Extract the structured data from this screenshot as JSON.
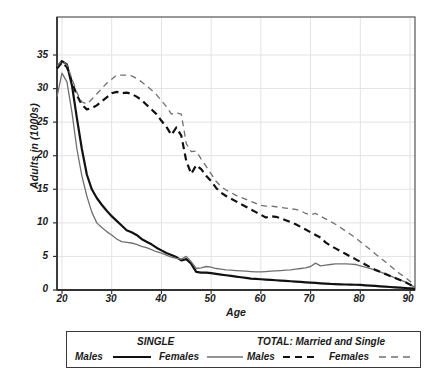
{
  "chart_data": {
    "type": "line",
    "title": "",
    "xlabel": "Age",
    "ylabel": "Adults in (1000s)",
    "xlim": [
      19,
      91
    ],
    "ylim": [
      0,
      38
    ],
    "xticks": [
      20,
      30,
      40,
      50,
      60,
      70,
      80,
      90
    ],
    "yticks": [
      0,
      5,
      10,
      15,
      20,
      25,
      30,
      35
    ],
    "grid": true,
    "legend_position": "below-plot",
    "x": [
      19,
      20,
      21,
      22,
      23,
      24,
      25,
      26,
      27,
      28,
      29,
      30,
      31,
      32,
      33,
      34,
      35,
      36,
      37,
      38,
      39,
      40,
      41,
      42,
      43,
      44,
      45,
      46,
      47,
      48,
      49,
      50,
      51,
      52,
      53,
      54,
      55,
      56,
      57,
      58,
      59,
      60,
      61,
      62,
      63,
      64,
      65,
      66,
      67,
      68,
      69,
      70,
      71,
      72,
      73,
      74,
      75,
      76,
      77,
      78,
      79,
      80,
      81,
      82,
      83,
      84,
      85,
      86,
      87,
      88,
      89,
      90,
      91
    ],
    "series": [
      {
        "name": "Males",
        "group": "SINGLE",
        "style": "solid",
        "color": "#111111",
        "width": 2.2,
        "values": [
          33.2,
          34.1,
          33.6,
          30.5,
          25.6,
          21.0,
          17.2,
          15.0,
          13.7,
          12.7,
          11.8,
          11.0,
          10.3,
          9.6,
          8.9,
          8.6,
          8.2,
          7.6,
          7.2,
          6.8,
          6.3,
          5.9,
          5.5,
          5.2,
          4.9,
          4.4,
          4.6,
          3.9,
          2.7,
          2.6,
          2.6,
          2.5,
          2.4,
          2.3,
          2.2,
          2.1,
          2.0,
          1.9,
          1.8,
          1.7,
          1.65,
          1.6,
          1.55,
          1.5,
          1.45,
          1.4,
          1.35,
          1.3,
          1.25,
          1.2,
          1.15,
          1.1,
          1.05,
          1.0,
          0.95,
          0.9,
          0.88,
          0.85,
          0.82,
          0.8,
          0.78,
          0.75,
          0.7,
          0.65,
          0.6,
          0.55,
          0.5,
          0.45,
          0.4,
          0.35,
          0.3,
          0.25,
          0.2
        ]
      },
      {
        "name": "Females",
        "group": "SINGLE",
        "style": "solid",
        "color": "#707070",
        "width": 1.3,
        "values": [
          28.8,
          32.3,
          31.0,
          26.5,
          21.0,
          17.0,
          14.0,
          11.6,
          10.0,
          9.3,
          8.7,
          8.2,
          7.6,
          7.2,
          7.1,
          7.0,
          6.8,
          6.5,
          6.3,
          6.0,
          5.7,
          5.5,
          5.2,
          4.9,
          4.7,
          4.6,
          5.0,
          4.2,
          3.2,
          3.3,
          3.5,
          3.4,
          3.2,
          3.1,
          3.0,
          2.95,
          2.9,
          2.85,
          2.8,
          2.75,
          2.7,
          2.7,
          2.75,
          2.8,
          2.85,
          2.9,
          2.95,
          3.0,
          3.1,
          3.2,
          3.3,
          3.5,
          4.0,
          3.6,
          3.7,
          3.8,
          3.9,
          3.9,
          3.9,
          3.85,
          3.8,
          3.6,
          3.4,
          3.2,
          3.0,
          2.7,
          2.4,
          2.1,
          1.8,
          1.5,
          1.2,
          0.8,
          0.4
        ]
      },
      {
        "name": "Males",
        "group": "TOTAL: Married and Single",
        "style": "dashed",
        "color": "#111111",
        "width": 2.2,
        "values": [
          33.0,
          33.9,
          33.2,
          31.0,
          29.0,
          27.6,
          26.9,
          27.1,
          27.5,
          28.1,
          28.7,
          29.3,
          29.5,
          29.3,
          29.4,
          29.2,
          28.8,
          28.3,
          27.6,
          26.9,
          26.2,
          25.2,
          24.3,
          23.1,
          24.2,
          23.0,
          19.2,
          17.3,
          18.6,
          18.0,
          17.0,
          16.2,
          15.2,
          14.5,
          14.0,
          13.6,
          13.2,
          12.8,
          12.4,
          12.0,
          11.6,
          11.2,
          10.8,
          11.0,
          10.9,
          10.7,
          10.4,
          10.1,
          9.8,
          9.4,
          9.0,
          8.6,
          8.2,
          7.8,
          7.1,
          6.6,
          6.2,
          5.8,
          5.4,
          5.0,
          4.6,
          4.2,
          3.8,
          3.4,
          3.0,
          2.7,
          2.4,
          2.1,
          1.8,
          1.5,
          1.2,
          0.8,
          0.4
        ]
      },
      {
        "name": "Females",
        "group": "TOTAL: Married and Single",
        "style": "dashed",
        "color": "#707070",
        "width": 1.3,
        "values": [
          33.3,
          34.2,
          33.5,
          31.5,
          29.4,
          28.0,
          27.7,
          28.4,
          29.2,
          30.0,
          30.8,
          31.4,
          32.0,
          32.0,
          32.0,
          31.9,
          31.5,
          31.0,
          30.4,
          29.8,
          29.1,
          28.2,
          27.3,
          26.2,
          26.4,
          26.2,
          21.8,
          20.6,
          20.7,
          19.5,
          18.4,
          17.3,
          16.2,
          15.4,
          14.9,
          14.5,
          14.1,
          13.8,
          13.5,
          13.2,
          12.9,
          12.6,
          12.5,
          12.5,
          12.4,
          12.3,
          12.2,
          12.1,
          12.0,
          11.8,
          11.4,
          11.2,
          11.4,
          11.0,
          10.6,
          10.2,
          9.8,
          9.3,
          8.8,
          8.3,
          7.8,
          7.2,
          6.6,
          6.0,
          5.4,
          4.8,
          4.2,
          3.6,
          3.0,
          2.4,
          1.9,
          1.3,
          0.6
        ]
      }
    ]
  },
  "axes": {
    "ylabel": "Adults in (1000s)",
    "xlabel": "Age",
    "ytick_labels": [
      "35",
      "30",
      "25",
      "20",
      "15",
      "10",
      "5",
      "0"
    ],
    "xtick_labels": [
      "20",
      "30",
      "40",
      "50",
      "60",
      "70",
      "80",
      "90"
    ]
  },
  "legend": {
    "groups": [
      {
        "title": "SINGLE",
        "entries": [
          {
            "label": "Males",
            "style": "solid",
            "color": "#111111"
          },
          {
            "label": "Females",
            "style": "solid",
            "color": "#707070"
          }
        ]
      },
      {
        "title": "TOTAL: Married and Single",
        "entries": [
          {
            "label": "Males",
            "style": "dashed",
            "color": "#111111"
          },
          {
            "label": "Females",
            "style": "dashed",
            "color": "#707070"
          }
        ]
      }
    ]
  },
  "colors": {
    "male": "#111111",
    "female": "#707070",
    "grid": "#e3e3e8",
    "frame": "#555555",
    "axis": "#333333",
    "background": "#ffffff"
  }
}
